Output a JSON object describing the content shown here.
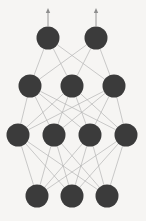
{
  "figure": {
    "background_color": "#f6f5f3",
    "width": 146,
    "height": 221
  },
  "chart_data": {
    "type": "diagram",
    "subtype": "neural-network-graph",
    "xlabel": "",
    "ylabel": "",
    "direction": "bottom-to-top",
    "node_color": "#3b3b3b",
    "node_radius": 11.5,
    "edge_color": "#b4b4b4",
    "edge_width": 0.7,
    "arrow_color": "#8e8e8e",
    "background": "#f6f5f3",
    "grid": false,
    "legend": false,
    "layer_count": 4,
    "node_counts": [
      3,
      4,
      3,
      2
    ],
    "total_nodes": 12,
    "total_edges": 30,
    "layers": [
      {
        "index": 0,
        "name": "input-layer",
        "role": "input",
        "count": 3,
        "y": 196,
        "x": [
          37,
          72,
          107
        ]
      },
      {
        "index": 1,
        "name": "hidden-layer-1",
        "role": "hidden",
        "count": 4,
        "y": 135,
        "x": [
          18,
          54,
          90,
          126
        ]
      },
      {
        "index": 2,
        "name": "hidden-layer-2",
        "role": "hidden",
        "count": 3,
        "y": 86,
        "x": [
          30,
          72,
          114
        ]
      },
      {
        "index": 3,
        "name": "output-layer",
        "role": "output",
        "count": 2,
        "y": 38,
        "x": [
          48,
          96
        ]
      }
    ],
    "connections": [
      {
        "from_layer": 0,
        "to_layer": 1,
        "pattern": "fully-connected",
        "count": 12
      },
      {
        "from_layer": 1,
        "to_layer": 2,
        "pattern": "fully-connected",
        "count": 12
      },
      {
        "from_layer": 2,
        "to_layer": 3,
        "pattern": "fully-connected",
        "count": 6
      }
    ],
    "output_arrows": [
      {
        "x": 48,
        "y_from": 26,
        "y_to": 8
      },
      {
        "x": 96,
        "y_from": 26,
        "y_to": 8
      }
    ]
  }
}
